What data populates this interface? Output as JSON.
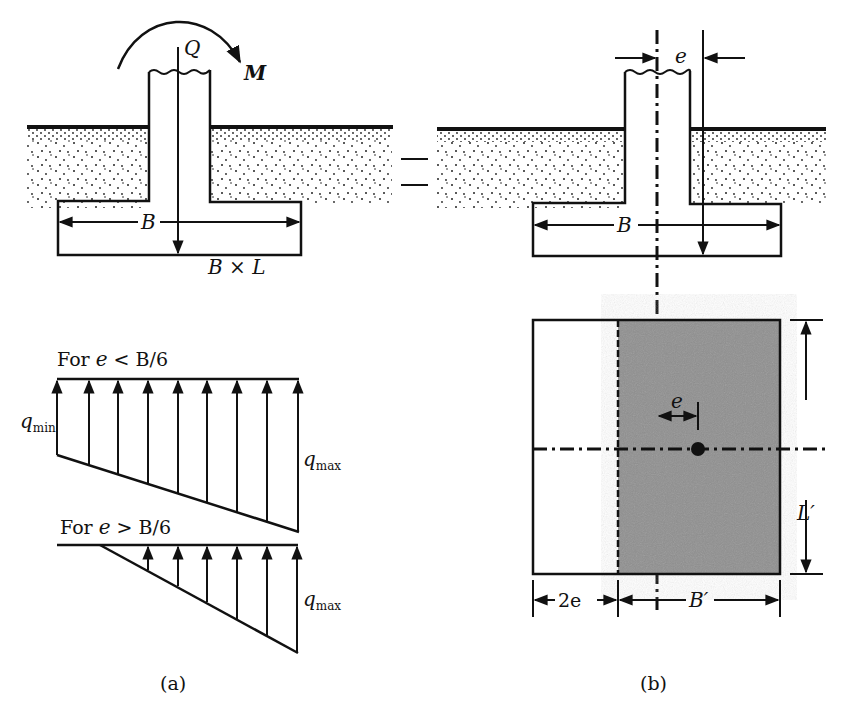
{
  "figure": {
    "panel_a": {
      "caption": "(a)",
      "load_label": "Q",
      "moment_label": "M",
      "width_label": "B",
      "footing_dims_label": "B × L",
      "case1": {
        "title_prefix": "For ",
        "title_var": "e",
        "title_rel": " < B/6",
        "qmin_base": "q",
        "qmin_sub": "min",
        "qmax_base": "q",
        "qmax_sub": "max"
      },
      "case2": {
        "title_prefix": "For ",
        "title_var": "e",
        "title_rel": " > B/6",
        "qmax_base": "q",
        "qmax_sub": "max"
      }
    },
    "equals_sign": "=",
    "panel_b": {
      "caption": "(b)",
      "eccentricity_label": "e",
      "width_label": "B",
      "plan_eccentricity_label": "e",
      "effective_length_label": "L′",
      "offset_label": "2e",
      "effective_width_label": "B′",
      "colors": {
        "effective_area_fill": "#8f8f8f",
        "line": "#111111"
      }
    }
  }
}
